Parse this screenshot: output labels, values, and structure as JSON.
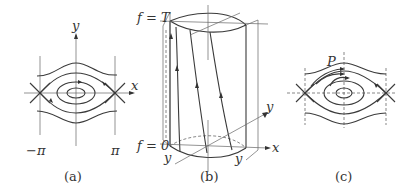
{
  "panels": {
    "a": {
      "caption": "(a)",
      "axis_x": "x",
      "axis_y": "y",
      "left_tick": "−π",
      "right_tick": "π"
    },
    "b": {
      "caption": "(b)",
      "top_label": "f = T",
      "bottom_label": "f = 0",
      "axis_x": "x",
      "axis_y_right": "y",
      "axis_y_left_bottom": "y",
      "axis_y_right_bottom": "y"
    },
    "c": {
      "caption": "(c)",
      "point_label": "P",
      "axis_x": "x",
      "axis_y": "y"
    }
  },
  "colors": {
    "ink": "#3a3a3a",
    "background": "#ffffff"
  }
}
